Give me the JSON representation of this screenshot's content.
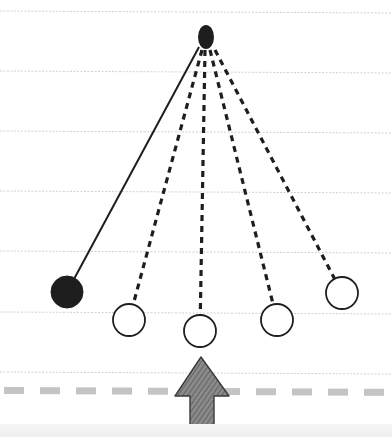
{
  "diagram": {
    "type": "pendulum-sketch",
    "colors": {
      "background": "#ffffff",
      "ruled_line": "#d0d0d0",
      "ink": "#1e1e1e",
      "reference_line": "#c4c4c4",
      "arrow_fill": "#8a8a8a",
      "arrow_hatch": "#5a5a5a",
      "bottom_band": "#efefef"
    },
    "ruled_lines_y": [
      11,
      71,
      131,
      191,
      251,
      312,
      372
    ],
    "pivot": {
      "x": 206,
      "y": 37,
      "rx": 8,
      "ry": 12
    },
    "bobs": [
      {
        "id": "bob-1",
        "cx": 67,
        "cy": 292,
        "r": 16,
        "filled": true,
        "string": "solid",
        "anchor_x": 199,
        "anchor_y": 47
      },
      {
        "id": "bob-2",
        "cx": 129,
        "cy": 320,
        "r": 16,
        "filled": false,
        "string": "dashed",
        "anchor_x": 202,
        "anchor_y": 50
      },
      {
        "id": "bob-3",
        "cx": 200,
        "cy": 331,
        "r": 16,
        "filled": false,
        "string": "dashed",
        "anchor_x": 205,
        "anchor_y": 50
      },
      {
        "id": "bob-4",
        "cx": 277,
        "cy": 320,
        "r": 16,
        "filled": false,
        "string": "dashed",
        "anchor_x": 210,
        "anchor_y": 50
      },
      {
        "id": "bob-5",
        "cx": 342,
        "cy": 293,
        "r": 16,
        "filled": false,
        "string": "dashed",
        "anchor_x": 215,
        "anchor_y": 50
      }
    ],
    "reference_line": {
      "y": 387,
      "height": 7,
      "dash": 20,
      "gap": 16,
      "start_x": 4
    },
    "arrow": {
      "direction": "up",
      "tip": [
        201,
        357
      ],
      "head_left": [
        175,
        396
      ],
      "head_right": [
        229,
        396
      ],
      "shaft_left": 190,
      "shaft_right": 214,
      "bottom": 437
    }
  }
}
